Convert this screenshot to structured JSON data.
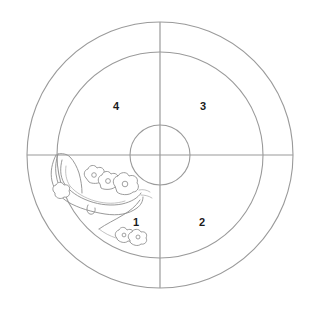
{
  "figure": {
    "type": "concentric-target-diagram",
    "background_color": "#ffffff",
    "line_color": "#9a9a9a",
    "label_color": "#1b1b1b",
    "sketch_color": "#8a8a8a",
    "center": {
      "x": 160,
      "y": 155
    },
    "rings": [
      {
        "name": "inner-circle",
        "radius": 30
      },
      {
        "name": "middle-circle",
        "radius": 103
      },
      {
        "name": "outer-circle",
        "radius": 133
      }
    ],
    "axes": [
      {
        "name": "horizontal-axis",
        "orientation": "horizontal"
      },
      {
        "name": "vertical-axis",
        "orientation": "vertical"
      }
    ]
  },
  "quadrants": [
    {
      "id": "q1",
      "label": "1",
      "position": "lower-left"
    },
    {
      "id": "q2",
      "label": "2",
      "position": "lower-right"
    },
    {
      "id": "q3",
      "label": "3",
      "position": "upper-right"
    },
    {
      "id": "q4",
      "label": "4",
      "position": "upper-left"
    }
  ],
  "sketch": {
    "name": "crescent-boat-with-blossoms",
    "description": "hand-drawn crescent boat shape filled with cloud-like blossom blobs",
    "located_in_quadrant": "1",
    "blossom_clusters": 3
  }
}
